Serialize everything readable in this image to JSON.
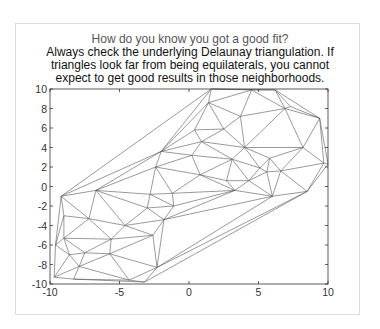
{
  "chart_data": {
    "type": "triangulation",
    "title_lines": [
      "How do you know you got a good fit?",
      "Always check the underlying Delaunay triangulation. If",
      "triangles look far from being equilaterals, you cannot",
      "expect to get good results in those neighborhoods."
    ],
    "xlim": [
      -10,
      10
    ],
    "ylim": [
      -10,
      10
    ],
    "xticks": [
      -10,
      -5,
      0,
      5,
      10
    ],
    "yticks": [
      -10,
      -8,
      -6,
      -4,
      -2,
      0,
      2,
      4,
      6,
      8,
      10
    ],
    "xlabel": "",
    "ylabel": "",
    "grid": false,
    "line_color": "#555555",
    "points": [
      [
        -9.2,
        -1.0
      ],
      [
        -9.7,
        -9.3
      ],
      [
        -9.6,
        -6.0
      ],
      [
        -9.0,
        -3.0
      ],
      [
        -9.0,
        -5.3
      ],
      [
        -8.6,
        -7.0
      ],
      [
        -8.3,
        -9.5
      ],
      [
        -7.5,
        -6.8
      ],
      [
        -7.2,
        -3.3
      ],
      [
        -6.7,
        -0.4
      ],
      [
        -5.7,
        -6.9
      ],
      [
        -5.6,
        -5.4
      ],
      [
        -4.6,
        -4.0
      ],
      [
        -7.9,
        -8.2
      ],
      [
        -4.3,
        -9.6
      ],
      [
        -3.2,
        -9.8
      ],
      [
        -2.3,
        -8.3
      ],
      [
        -2.6,
        -5.0
      ],
      [
        -3.0,
        -2.2
      ],
      [
        -1.8,
        -3.4
      ],
      [
        -1.1,
        -2.0
      ],
      [
        -1.2,
        -0.7
      ],
      [
        -2.8,
        -0.8
      ],
      [
        -2.4,
        2.0
      ],
      [
        -2.0,
        3.6
      ],
      [
        0.4,
        5.8
      ],
      [
        0.2,
        3.2
      ],
      [
        0.9,
        4.6
      ],
      [
        0.8,
        1.2
      ],
      [
        1.6,
        10.0
      ],
      [
        1.4,
        8.6
      ],
      [
        2.5,
        5.9
      ],
      [
        3.7,
        7.2
      ],
      [
        4.0,
        4.0
      ],
      [
        3.1,
        2.8
      ],
      [
        2.7,
        0.6
      ],
      [
        3.3,
        -0.4
      ],
      [
        4.3,
        0.6
      ],
      [
        5.1,
        1.9
      ],
      [
        4.5,
        9.9
      ],
      [
        6.2,
        9.9
      ],
      [
        7.3,
        8.2
      ],
      [
        6.9,
        8.0
      ],
      [
        5.8,
        2.9
      ],
      [
        5.6,
        1.5
      ],
      [
        6.6,
        1.6
      ],
      [
        9.7,
        2.4
      ],
      [
        8.5,
        -0.5
      ],
      [
        9.4,
        7.0
      ],
      [
        8.2,
        4.0
      ],
      [
        10.0,
        2.3
      ],
      [
        6.0,
        -1.0
      ]
    ],
    "hull": [
      0,
      9,
      23,
      29,
      39,
      40,
      48,
      50,
      47,
      16,
      15,
      14,
      6,
      1,
      2,
      3,
      0
    ]
  }
}
